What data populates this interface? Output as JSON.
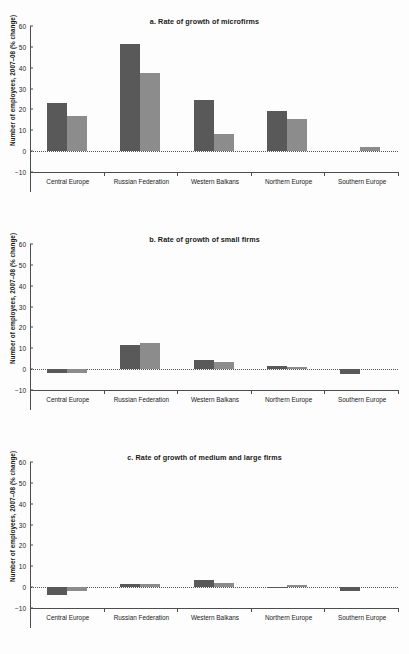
{
  "figure": {
    "panel_count": 3,
    "shared_ylabel": "Number of employees, 2007–08 (% change)",
    "categories": [
      "Central Europe",
      "Russian Federation",
      "Western Balkans",
      "Northern Europe",
      "Southern Europe"
    ],
    "yticks": [
      "60",
      "50",
      "40",
      "30",
      "20",
      "10",
      "0",
      "−10"
    ],
    "colors": {
      "series1": "#595959",
      "series2": "#8c8c8c",
      "axis": "#4d4d4d",
      "text": "#1a1a1a",
      "background": "#fdfdfd"
    }
  },
  "chart_data": [
    {
      "type": "bar",
      "title": "a. Rate of growth of microfirms",
      "xlabel": "",
      "ylabel": "Number of employees, 2007–08 (% change)",
      "ylim": [
        -10,
        60
      ],
      "yticks": [
        -10,
        0,
        10,
        20,
        30,
        40,
        50,
        60
      ],
      "grid": false,
      "legend": "none",
      "categories": [
        "Central Europe",
        "Russian Federation",
        "Western Balkans",
        "Northern Europe",
        "Southern Europe"
      ],
      "series": [
        {
          "name": "series 1",
          "values": [
            23.0,
            51.5,
            24.5,
            19.3,
            null
          ]
        },
        {
          "name": "series 2",
          "values": [
            17.0,
            37.5,
            8.0,
            15.2,
            2.0
          ]
        }
      ]
    },
    {
      "type": "bar",
      "title": "b. Rate of growth of small firms",
      "xlabel": "",
      "ylabel": "Number of employees, 2007–08 (% change)",
      "ylim": [
        -10,
        60
      ],
      "yticks": [
        -10,
        0,
        10,
        20,
        30,
        40,
        50,
        60
      ],
      "grid": false,
      "legend": "none",
      "categories": [
        "Central Europe",
        "Russian Federation",
        "Western Balkans",
        "Northern Europe",
        "Southern Europe"
      ],
      "series": [
        {
          "name": "series 1",
          "values": [
            -1.8,
            11.8,
            4.5,
            1.4,
            -2.5
          ]
        },
        {
          "name": "series 2",
          "values": [
            -1.8,
            12.3,
            3.4,
            1.1,
            null
          ]
        }
      ]
    },
    {
      "type": "bar",
      "title": "c. Rate of growth of medium and large firms",
      "xlabel": "",
      "ylabel": "Number of employees, 2007–08 (% change)",
      "ylim": [
        -10,
        60
      ],
      "yticks": [
        -10,
        0,
        10,
        20,
        30,
        40,
        50,
        60
      ],
      "grid": false,
      "legend": "none",
      "categories": [
        "Central Europe",
        "Russian Federation",
        "Western Balkans",
        "Northern Europe",
        "Southern Europe"
      ],
      "series": [
        {
          "name": "series 1",
          "values": [
            -4.0,
            1.5,
            3.5,
            -0.3,
            -1.8
          ]
        },
        {
          "name": "series 2",
          "values": [
            -1.8,
            1.7,
            2.1,
            0.9,
            null
          ]
        }
      ]
    }
  ]
}
